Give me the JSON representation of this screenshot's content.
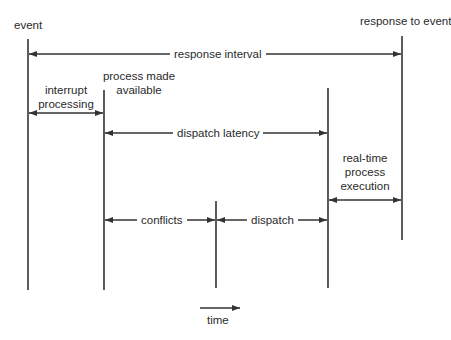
{
  "diagram": {
    "colors": {
      "line": "#333333",
      "text": "#2a2a2a",
      "background": "#ffffff"
    },
    "timelines": [
      {
        "id": "event",
        "label": "event",
        "x": 28,
        "y1": 39,
        "y2": 290
      },
      {
        "id": "process-made-available",
        "label": "process made available",
        "x": 104,
        "y1": 90,
        "y2": 290
      },
      {
        "id": "conflicts-end",
        "label": "",
        "x": 216,
        "y1": 201,
        "y2": 288
      },
      {
        "id": "dispatch-end",
        "label": "",
        "x": 328,
        "y1": 88,
        "y2": 288
      },
      {
        "id": "response-to-event",
        "label": "response to event",
        "x": 402,
        "y1": 36,
        "y2": 240
      }
    ],
    "spans": [
      {
        "id": "response-interval",
        "label": "response interval",
        "from": "event",
        "to": "response-to-event",
        "y": 54
      },
      {
        "id": "interrupt-processing",
        "label": "interrupt processing",
        "from": "event",
        "to": "process-made-available",
        "y": 113
      },
      {
        "id": "dispatch-latency",
        "label": "dispatch latency",
        "from": "process-made-available",
        "to": "dispatch-end",
        "y": 133
      },
      {
        "id": "real-time-process-execution",
        "label": "real-time process execution",
        "from": "dispatch-end",
        "to": "response-to-event",
        "y": 200
      },
      {
        "id": "conflicts",
        "label": "conflicts",
        "from": "process-made-available",
        "to": "conflicts-end",
        "y": 220
      },
      {
        "id": "dispatch",
        "label": "dispatch",
        "from": "conflicts-end",
        "to": "dispatch-end",
        "y": 220
      }
    ],
    "time_axis": {
      "label": "time",
      "direction": "right"
    }
  },
  "labels": {
    "event": "event",
    "response_to_event": "response to event",
    "response_interval": "response interval",
    "interrupt_line1": "interrupt",
    "interrupt_line2": "processing",
    "process_line1": "process made",
    "process_line2": "available",
    "dispatch_latency": "dispatch latency",
    "rt_line1": "real-time",
    "rt_line2": "process",
    "rt_line3": "execution",
    "conflicts": "conflicts",
    "dispatch": "dispatch",
    "time": "time"
  }
}
